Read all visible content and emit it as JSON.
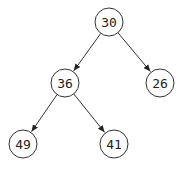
{
  "diagram": {
    "type": "binary-tree",
    "nodes": [
      {
        "id": "n30",
        "label": "30",
        "x": 109,
        "y": 22
      },
      {
        "id": "n36",
        "label": "36",
        "x": 65,
        "y": 83
      },
      {
        "id": "n26",
        "label": "26",
        "x": 160,
        "y": 83
      },
      {
        "id": "n49",
        "label": "49",
        "x": 23,
        "y": 144
      },
      {
        "id": "n41",
        "label": "41",
        "x": 114,
        "y": 144
      }
    ],
    "edges": [
      {
        "from": "n30",
        "to": "n36"
      },
      {
        "from": "n30",
        "to": "n26"
      },
      {
        "from": "n36",
        "to": "n49"
      },
      {
        "from": "n36",
        "to": "n41"
      }
    ],
    "node_radius": 14,
    "colors": {
      "stroke": "#333333",
      "fill": "#ffffff",
      "text": "#222222"
    }
  }
}
